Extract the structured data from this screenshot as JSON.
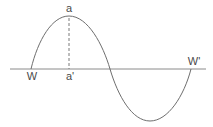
{
  "diagram": {
    "type": "sine-wave",
    "labels": {
      "crest": "a",
      "crest_foot": "a'",
      "start": "W",
      "end": "W'"
    },
    "colors": {
      "wave": "#6e6e6e",
      "axis": "#8a8a8a",
      "text": "#4a4a4a"
    }
  }
}
